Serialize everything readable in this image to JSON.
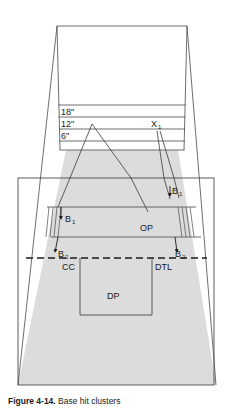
{
  "figure": {
    "caption_label": "Figure 4-14.",
    "caption_text": "Base hit clusters",
    "background_color": "#ffffff",
    "line_color": "#3f3f3f",
    "shade_color": "#dcdcdc",
    "text_color": "#1a1a1a"
  },
  "measurements": {
    "band_18": "18\"",
    "band_12": "12\"",
    "band_6": "6\""
  },
  "markers": {
    "x1_base": "X",
    "x1_sub": "1",
    "b1_base": "B",
    "b1_sub": "1",
    "b2_base": "B",
    "b2_sub": "2",
    "op": "OP",
    "cc": "CC",
    "dtl": "DTL",
    "dp": "DP"
  },
  "geometry": {
    "outer_frame": {
      "x": 18,
      "y": 178,
      "width": 196,
      "height": 207
    },
    "top_box": {
      "left": 57,
      "right": 187,
      "top": 26
    },
    "bands": {
      "y18": 105,
      "y12": 117,
      "y6": 129,
      "ybottom": 141
    },
    "dashed_line_y": 258,
    "shade_top_y": 150
  }
}
